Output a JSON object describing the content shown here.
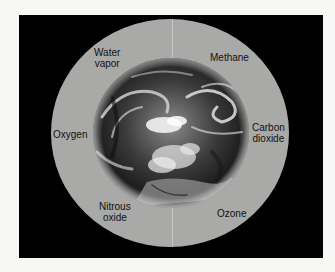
{
  "diagram": {
    "center": {
      "label": "Earth",
      "icon": "earth-globe-image"
    },
    "labels": [
      {
        "id": "water-vapor",
        "text": "Water\nvapor"
      },
      {
        "id": "methane",
        "text": "Methane"
      },
      {
        "id": "oxygen",
        "text": "Oxygen"
      },
      {
        "id": "carbon-dioxide",
        "text": "Carbon\ndioxide"
      },
      {
        "id": "nitrous-oxide",
        "text": "Nitrous\noxide"
      },
      {
        "id": "ozone",
        "text": "Ozone"
      }
    ],
    "colors": {
      "background": "#000000",
      "atmosphere_ring": "#a9a9a7",
      "page": "#f7f7f5",
      "text": "#111111"
    }
  }
}
